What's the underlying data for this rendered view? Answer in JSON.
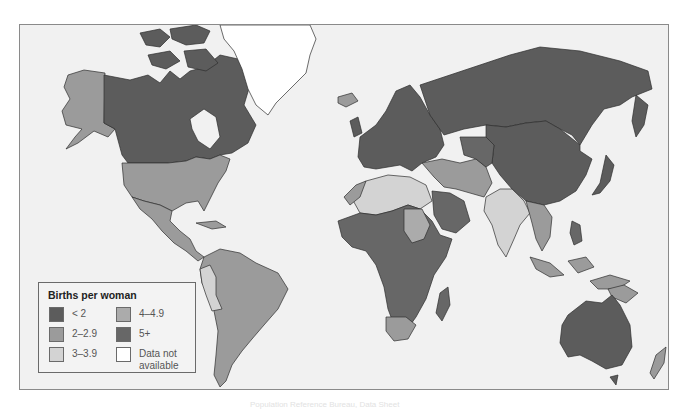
{
  "map": {
    "title": "Births per woman",
    "type": "choropleth world map",
    "colors": {
      "ocean": "#f1f1f1",
      "lt2": "#5c5c5c",
      "c2_2_9": "#9b9b9b",
      "c3_3_9": "#d3d3d3",
      "c4_4_9": "#ababab",
      "c5plus": "#676767",
      "na": "#ffffff",
      "border": "#2e2e2e"
    }
  },
  "legend": {
    "title": "Births per woman",
    "items": [
      {
        "label": "< 2",
        "color": "#5c5c5c"
      },
      {
        "label": "2–2.9",
        "color": "#9b9b9b"
      },
      {
        "label": "3–3.9",
        "color": "#d3d3d3"
      },
      {
        "label": "4–4.9",
        "color": "#ababab"
      },
      {
        "label": "5+",
        "color": "#676767"
      },
      {
        "label": "Data not",
        "label2": "available",
        "color": "#ffffff"
      }
    ]
  },
  "regions": [
    {
      "name": "Canada",
      "category": "< 2"
    },
    {
      "name": "Alaska (USA)",
      "category": "2–2.9"
    },
    {
      "name": "United States",
      "category": "2–2.9"
    },
    {
      "name": "Greenland",
      "category": "Data not available"
    },
    {
      "name": "Mexico & Central America",
      "category": "2–2.9"
    },
    {
      "name": "South America",
      "category": "2–2.9"
    },
    {
      "name": "Peru / Bolivia",
      "category": "3–3.9"
    },
    {
      "name": "Europe",
      "category": "< 2"
    },
    {
      "name": "Russia",
      "category": "< 2"
    },
    {
      "name": "Mongolia",
      "category": "2–2.9"
    },
    {
      "name": "China",
      "category": "< 2"
    },
    {
      "name": "North Africa",
      "category": "3–3.9"
    },
    {
      "name": "Sub-Saharan Africa",
      "category": "5+"
    },
    {
      "name": "Sudan",
      "category": "4–4.9"
    },
    {
      "name": "South Africa",
      "category": "2–2.9"
    },
    {
      "name": "Middle East / Iran",
      "category": "2–2.9"
    },
    {
      "name": "India",
      "category": "3–3.9"
    },
    {
      "name": "Southeast Asia",
      "category": "2–2.9"
    },
    {
      "name": "Australia",
      "category": "< 2"
    },
    {
      "name": "New Zealand",
      "category": "2–2.9"
    },
    {
      "name": "Japan",
      "category": "< 2"
    }
  ],
  "caption": "Population Reference Bureau, Data Sheet"
}
